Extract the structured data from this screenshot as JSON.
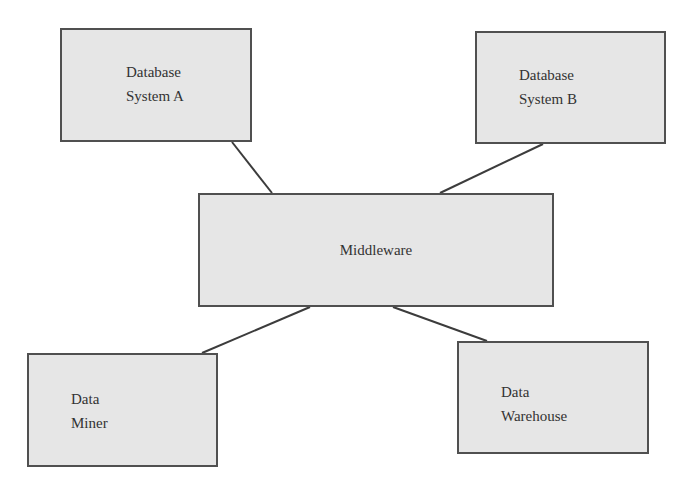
{
  "diagram": {
    "type": "architecture",
    "colors": {
      "box_fill": "#e6e6e6",
      "box_border": "#505050",
      "connector": "#3c3c3c",
      "text": "#333333",
      "background": "#ffffff"
    },
    "nodes": {
      "database_a": {
        "line1": "Database",
        "line2": "System A"
      },
      "database_b": {
        "line1": "Database",
        "line2": "System B"
      },
      "middleware": {
        "label": "Middleware"
      },
      "data_miner": {
        "line1": "Data",
        "line2": "Miner"
      },
      "data_warehouse": {
        "line1": "Data",
        "line2": "Warehouse"
      }
    },
    "edges": [
      {
        "from": "Database System A",
        "to": "Middleware",
        "x1": 232,
        "y1": 142,
        "x2": 272,
        "y2": 193
      },
      {
        "from": "Database System B",
        "to": "Middleware",
        "x1": 543,
        "y1": 144,
        "x2": 440,
        "y2": 193
      },
      {
        "from": "Middleware",
        "to": "Data Miner",
        "x1": 310,
        "y1": 307,
        "x2": 202,
        "y2": 353
      },
      {
        "from": "Middleware",
        "to": "Data Warehouse",
        "x1": 393,
        "y1": 307,
        "x2": 487,
        "y2": 341
      }
    ]
  }
}
